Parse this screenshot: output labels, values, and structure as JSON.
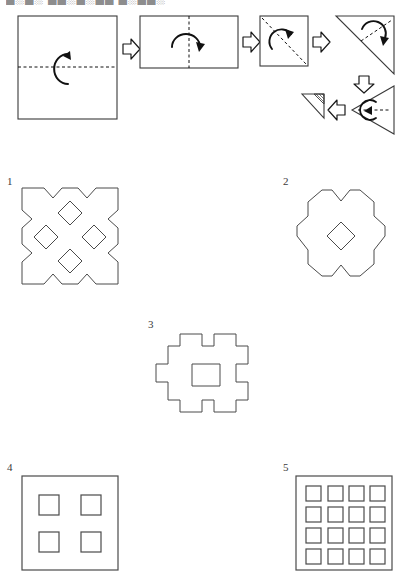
{
  "page": {
    "width": 406,
    "height": 579,
    "background": "#ffffff",
    "stroke_color": "#2b2b2b",
    "cut_header_text": "█░█░  ██░█░██  █░██░"
  },
  "fold_sequence": {
    "name": "paper-folding-sequence",
    "steps": [
      {
        "index": 1,
        "shape": "square",
        "fold_line": "horizontal-dashed-center",
        "rotation_arrow": "curved-up-arrow",
        "label": ""
      },
      {
        "index": 2,
        "shape": "horizontal-rectangle",
        "fold_line": "vertical-dashed-center",
        "rotation_arrow": "curved-right-arrow",
        "label": ""
      },
      {
        "index": 3,
        "shape": "small-square",
        "fold_line": "diagonal-dashed",
        "rotation_arrow": "curved-up-arrow",
        "label": ""
      },
      {
        "index": 4,
        "shape": "large-triangle",
        "fold_line": "diagonal-dashed",
        "rotation_arrow": "curved-arrow",
        "label": ""
      },
      {
        "index": 5,
        "shape": "left-pointing-triangle",
        "fold_line": "horizontal-dashed",
        "rotation_arrow": "curved-left-arrow",
        "label": ""
      },
      {
        "index": 6,
        "shape": "small-hatched-triangle",
        "fold_line": "none",
        "rotation_arrow": "none",
        "label": ""
      }
    ],
    "arrows": [
      {
        "name": "arrow-step-1-to-2",
        "direction": "right"
      },
      {
        "name": "arrow-step-2-to-3",
        "direction": "right"
      },
      {
        "name": "arrow-step-3-to-4",
        "direction": "right"
      },
      {
        "name": "arrow-step-4-to-5",
        "direction": "down"
      },
      {
        "name": "arrow-step-5-to-6",
        "direction": "left"
      }
    ]
  },
  "options": [
    {
      "label": "1",
      "name": "option-1",
      "description": "square with V notches on all four sides and four diamond holes",
      "holes": 4,
      "hole_shape": "diamond"
    },
    {
      "label": "2",
      "name": "option-2",
      "description": "rounded four-lobed shape with V notches and one central diamond hole",
      "holes": 1,
      "hole_shape": "diamond"
    },
    {
      "label": "3",
      "name": "option-3",
      "description": "stepped cross outline with one central square hole",
      "holes": 1,
      "hole_shape": "square"
    },
    {
      "label": "4",
      "name": "option-4",
      "description": "plain square with four square holes in a 2 by 2 grid",
      "holes": 4,
      "hole_shape": "square"
    },
    {
      "label": "5",
      "name": "option-5",
      "description": "plain square with sixteen square holes in a 4 by 4 grid",
      "holes": 16,
      "hole_shape": "square"
    }
  ]
}
